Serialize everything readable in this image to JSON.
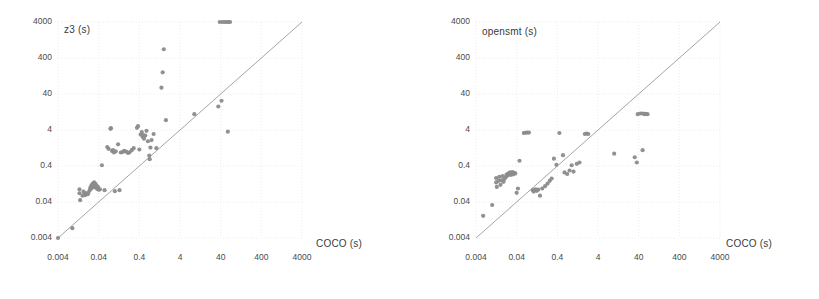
{
  "figure": {
    "background": "#ffffff",
    "point_color": "#8b8b8b",
    "line_color": "#9a9a9a",
    "grid_color": "#e8e8e8",
    "text_color": "#4a4a4a"
  },
  "panels": [
    {
      "name": "z3-scatter",
      "chart_data": {
        "type": "scatter",
        "title": "",
        "xlabel": "COCO (s)",
        "ylabel": "z3 (s)",
        "xscale": "log",
        "yscale": "log",
        "xlim": [
          0.004,
          4000
        ],
        "ylim": [
          0.004,
          4000
        ],
        "xticks": [
          "0.004",
          "0.04",
          "0.4",
          "4",
          "40",
          "400",
          "4000"
        ],
        "yticks": [
          "0.004",
          "0.04",
          "0.4",
          "4",
          "40",
          "400",
          "4000"
        ],
        "xtick_values": [
          0.004,
          0.04,
          0.4,
          4,
          40,
          400,
          4000
        ],
        "ytick_values": [
          0.004,
          0.04,
          0.4,
          4,
          40,
          400,
          4000
        ],
        "grid": true,
        "legend": "none",
        "annotations": [
          {
            "text": "diagonal y = x reference line",
            "type": "line",
            "from": [
              0.004,
              0.004
            ],
            "to": [
              4000,
              4000
            ]
          }
        ],
        "series": [
          {
            "name": "COCO vs z3",
            "marker": "circle",
            "color": "#8b8b8b",
            "points": [
              [
                0.004,
                0.004
              ],
              [
                0.009,
                0.0075
              ],
              [
                0.0135,
                0.07
              ],
              [
                0.0135,
                0.09
              ],
              [
                0.014,
                0.045
              ],
              [
                0.016,
                0.06
              ],
              [
                0.017,
                0.078
              ],
              [
                0.018,
                0.065
              ],
              [
                0.0185,
                0.062
              ],
              [
                0.0195,
                0.07
              ],
              [
                0.0205,
                0.068
              ],
              [
                0.0215,
                0.066
              ],
              [
                0.0225,
                0.072
              ],
              [
                0.024,
                0.085
              ],
              [
                0.025,
                0.1
              ],
              [
                0.0255,
                0.092
              ],
              [
                0.0265,
                0.115
              ],
              [
                0.027,
                0.098
              ],
              [
                0.028,
                0.125
              ],
              [
                0.0285,
                0.108
              ],
              [
                0.0295,
                0.132
              ],
              [
                0.03,
                0.12
              ],
              [
                0.031,
                0.14
              ],
              [
                0.0315,
                0.105
              ],
              [
                0.0325,
                0.118
              ],
              [
                0.0335,
                0.128
              ],
              [
                0.0345,
                0.1
              ],
              [
                0.0355,
                0.112
              ],
              [
                0.037,
                0.092
              ],
              [
                0.0385,
                0.105
              ],
              [
                0.04,
                0.088
              ],
              [
                0.043,
                0.09
              ],
              [
                0.048,
                0.42
              ],
              [
                0.056,
                0.085
              ],
              [
                0.065,
                1.35
              ],
              [
                0.07,
                1.2
              ],
              [
                0.078,
                4.3
              ],
              [
                0.08,
                4.5
              ],
              [
                0.085,
                1.05
              ],
              [
                0.09,
                1.1
              ],
              [
                0.095,
                0.95
              ],
              [
                0.1,
                0.08
              ],
              [
                0.105,
                1.02
              ],
              [
                0.12,
                1.6
              ],
              [
                0.13,
                0.085
              ],
              [
                0.14,
                0.95
              ],
              [
                0.155,
                0.98
              ],
              [
                0.17,
                1.05
              ],
              [
                0.19,
                1.0
              ],
              [
                0.21,
                0.92
              ],
              [
                0.23,
                0.96
              ],
              [
                0.26,
                1.1
              ],
              [
                0.29,
                1.25
              ],
              [
                0.35,
                4.6
              ],
              [
                0.37,
                5.1
              ],
              [
                0.4,
                1.15
              ],
              [
                0.43,
                3.0
              ],
              [
                0.46,
                3.5
              ],
              [
                0.48,
                2.6
              ],
              [
                0.5,
                2.9
              ],
              [
                0.52,
                2.3
              ],
              [
                0.56,
                2.8
              ],
              [
                0.6,
                3.8
              ],
              [
                0.65,
                1.95
              ],
              [
                0.7,
                0.78
              ],
              [
                0.72,
                0.62
              ],
              [
                0.75,
                1.3
              ],
              [
                0.8,
                2.1
              ],
              [
                0.9,
                3.1
              ],
              [
                1.05,
                1.25
              ],
              [
                1.4,
                60.0
              ],
              [
                1.5,
                160.0
              ],
              [
                1.6,
                700.0
              ],
              [
                1.8,
                7.5
              ],
              [
                9.0,
                11.0
              ],
              [
                35.0,
                18.0
              ],
              [
                42.0,
                26.0
              ],
              [
                60.0,
                3.6
              ],
              [
                38.0,
                4000
              ],
              [
                44.0,
                4000
              ],
              [
                50.0,
                4000
              ],
              [
                56.0,
                4000
              ],
              [
                62.0,
                4000
              ],
              [
                68.0,
                4000
              ]
            ]
          }
        ]
      }
    },
    {
      "name": "opensmt-scatter",
      "chart_data": {
        "type": "scatter",
        "title": "",
        "xlabel": "COCO (s)",
        "ylabel": "opensmt (s)",
        "xscale": "log",
        "yscale": "log",
        "xlim": [
          0.004,
          4000
        ],
        "ylim": [
          0.004,
          4000
        ],
        "xticks": [
          "0.004",
          "0.04",
          "0.4",
          "4",
          "40",
          "400",
          "4000"
        ],
        "yticks": [
          "0.004",
          "0.04",
          "0.4",
          "4",
          "40",
          "400",
          "4000"
        ],
        "xtick_values": [
          0.004,
          0.04,
          0.4,
          4,
          40,
          400,
          4000
        ],
        "ytick_values": [
          0.004,
          0.04,
          0.4,
          4,
          40,
          400,
          4000
        ],
        "grid": true,
        "legend": "none",
        "annotations": [
          {
            "text": "diagonal y = x reference line",
            "type": "line",
            "from": [
              0.004,
              0.004
            ],
            "to": [
              4000,
              4000
            ]
          }
        ],
        "series": [
          {
            "name": "COCO vs opensmt",
            "marker": "circle",
            "color": "#8b8b8b",
            "points": [
              [
                0.006,
                0.0165
              ],
              [
                0.01,
                0.033
              ],
              [
                0.0125,
                0.14
              ],
              [
                0.0125,
                0.185
              ],
              [
                0.013,
                0.105
              ],
              [
                0.0145,
                0.155
              ],
              [
                0.015,
                0.2
              ],
              [
                0.016,
                0.12
              ],
              [
                0.017,
                0.16
              ],
              [
                0.018,
                0.21
              ],
              [
                0.019,
                0.145
              ],
              [
                0.02,
                0.175
              ],
              [
                0.0215,
                0.195
              ],
              [
                0.0225,
                0.23
              ],
              [
                0.0235,
                0.215
              ],
              [
                0.025,
                0.25
              ],
              [
                0.0265,
                0.24
              ],
              [
                0.0275,
                0.265
              ],
              [
                0.0285,
                0.225
              ],
              [
                0.03,
                0.255
              ],
              [
                0.0315,
                0.27
              ],
              [
                0.033,
                0.235
              ],
              [
                0.0345,
                0.26
              ],
              [
                0.037,
                0.248
              ],
              [
                0.04,
                0.072
              ],
              [
                0.043,
                0.095
              ],
              [
                0.047,
                0.56
              ],
              [
                0.06,
                3.3
              ],
              [
                0.065,
                3.35
              ],
              [
                0.072,
                3.4
              ],
              [
                0.08,
                3.4
              ],
              [
                0.1,
                0.085
              ],
              [
                0.105,
                0.078
              ],
              [
                0.115,
                0.09
              ],
              [
                0.125,
                0.082
              ],
              [
                0.135,
                0.088
              ],
              [
                0.15,
                0.06
              ],
              [
                0.17,
                0.095
              ],
              [
                0.2,
                0.11
              ],
              [
                0.23,
                0.13
              ],
              [
                0.26,
                0.155
              ],
              [
                0.29,
                0.18
              ],
              [
                0.33,
                0.64
              ],
              [
                0.38,
                0.43
              ],
              [
                0.45,
                3.3
              ],
              [
                0.55,
                0.8
              ],
              [
                0.6,
                0.265
              ],
              [
                0.7,
                0.24
              ],
              [
                0.8,
                0.3
              ],
              [
                0.9,
                0.42
              ],
              [
                1.0,
                0.28
              ],
              [
                1.2,
                0.46
              ],
              [
                1.4,
                0.5
              ],
              [
                1.9,
                3.1
              ],
              [
                2.1,
                3.2
              ],
              [
                2.3,
                3.1
              ],
              [
                10.0,
                0.88
              ],
              [
                32.0,
                0.7
              ],
              [
                36.0,
                0.5
              ],
              [
                50.0,
                1.1
              ],
              [
                38.0,
                11.0
              ],
              [
                44.0,
                11.5
              ],
              [
                50.0,
                11.5
              ],
              [
                56.0,
                11.0
              ],
              [
                60.0,
                11.2
              ],
              [
                66.0,
                11.0
              ]
            ]
          }
        ]
      }
    }
  ]
}
